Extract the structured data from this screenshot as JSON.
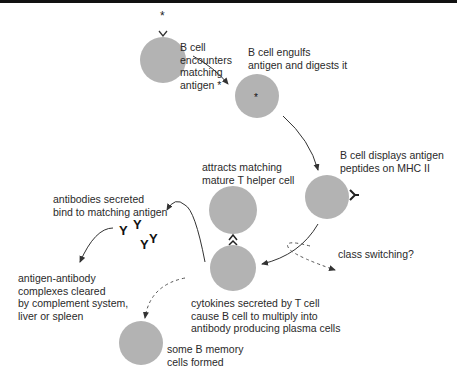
{
  "colors": {
    "cell_fill": "#b3b3b3",
    "line": "#333333",
    "text": "#2a2a2a",
    "top_bar": "#111111"
  },
  "labels": {
    "encounter": "B cell\nencounters\nmatching\nantigen *",
    "engulf": "B cell engulfs\nantigen and digests it",
    "display": "B cell displays antigen\npeptides on MHC II",
    "attracts": "attracts matching\nmature T helper cell",
    "antibodies": "antibodies secreted\nbind to matching antigen",
    "cleared": "antigen-antibody\ncomplexes cleared\nby complement system,\nliver or spleen",
    "cytokines": "cytokines secreted by T cell\ncause B cell to multiply into\nantibody producing plasma cells",
    "class_switching": "class switching?",
    "memory": "some B memory\ncells formed"
  },
  "icons": {
    "antigen": "asterisk-antigen-icon",
    "receptor": "y-receptor-icon",
    "antibody": "Y"
  }
}
